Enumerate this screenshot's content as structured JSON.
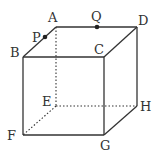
{
  "diagram": {
    "type": "cube",
    "vertices": {
      "A": {
        "label": "A",
        "x": 56,
        "y": 27
      },
      "B": {
        "label": "B",
        "x": 23,
        "y": 57
      },
      "C": {
        "label": "C",
        "x": 104,
        "y": 57
      },
      "D": {
        "label": "D",
        "x": 137,
        "y": 27
      },
      "E": {
        "label": "E",
        "x": 56,
        "y": 106
      },
      "F": {
        "label": "F",
        "x": 23,
        "y": 135
      },
      "G": {
        "label": "G",
        "x": 104,
        "y": 135
      },
      "H": {
        "label": "H",
        "x": 137,
        "y": 106
      }
    },
    "points": {
      "P": {
        "label": "P",
        "on_edge": "AB",
        "x": 45,
        "y": 37
      },
      "Q": {
        "label": "Q",
        "on_edge": "AD",
        "x": 97,
        "y": 27
      }
    },
    "hidden_edges": [
      "AE",
      "EF",
      "EH"
    ],
    "visible_edges": [
      "AB",
      "AD",
      "BC",
      "CD",
      "BF",
      "CG",
      "DH",
      "FG",
      "GH"
    ]
  }
}
